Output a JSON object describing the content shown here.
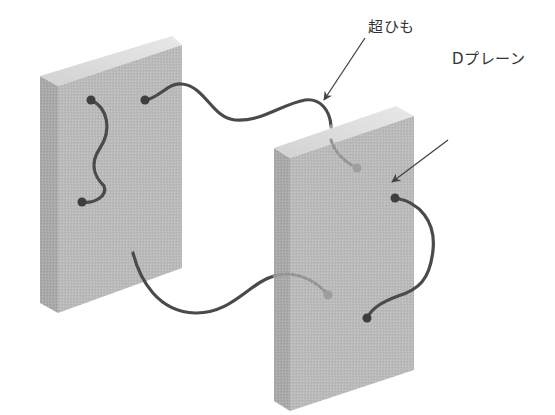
{
  "diagram": {
    "labels": {
      "superstring": "超ひも",
      "dbrane": "Dプレーン"
    },
    "colors": {
      "background": "#ffffff",
      "panel_front": "#b9b9b9",
      "panel_side": "#a8a8a8",
      "panel_top": "#dcdcdc",
      "string": "#4a4a4a",
      "string_hidden": "#8c8c8c",
      "arrow": "#444444",
      "text": "#333333"
    },
    "panels": [
      {
        "name": "left-dbrane",
        "front": [
          [
            58,
            86
          ],
          [
            182,
            45
          ],
          [
            182,
            268
          ],
          [
            58,
            313
          ]
        ],
        "side": [
          [
            40,
            76
          ],
          [
            58,
            86
          ],
          [
            58,
            313
          ],
          [
            40,
            303
          ]
        ],
        "top": [
          [
            40,
            76
          ],
          [
            172,
            36
          ],
          [
            182,
            45
          ],
          [
            58,
            86
          ]
        ]
      },
      {
        "name": "right-dbrane",
        "front": [
          [
            290,
            158
          ],
          [
            414,
            116
          ],
          [
            414,
            370
          ],
          [
            290,
            411
          ]
        ],
        "side": [
          [
            274,
            148
          ],
          [
            290,
            158
          ],
          [
            290,
            411
          ],
          [
            274,
            401
          ]
        ],
        "top": [
          [
            274,
            148
          ],
          [
            396,
            106
          ],
          [
            414,
            116
          ],
          [
            290,
            158
          ]
        ]
      }
    ],
    "strings": [
      {
        "name": "open-string-left-panel",
        "endpoints": [
          [
            91,
            100
          ],
          [
            82,
            202
          ]
        ]
      },
      {
        "name": "string-connecting-panels-top",
        "endpoints": [
          [
            145,
            100
          ],
          [
            357,
            168
          ]
        ]
      },
      {
        "name": "open-string-right-panel",
        "endpoints": [
          [
            395,
            198
          ],
          [
            367,
            318
          ]
        ]
      },
      {
        "name": "string-connecting-panels-bottom",
        "endpoints": [
          [
            133,
            253
          ],
          [
            328,
            295
          ]
        ]
      }
    ]
  }
}
